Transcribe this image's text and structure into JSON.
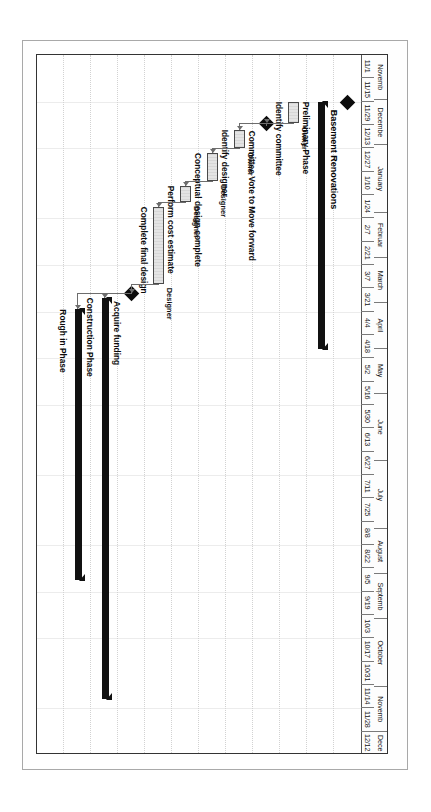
{
  "document": {
    "type": "gantt-chart-printout",
    "orientation": "rotated-90-clockwise",
    "project_title": "Basement Renovations"
  },
  "timescale": {
    "months": [
      {
        "label": "Novemb",
        "weeks": 2
      },
      {
        "label": "Decembe",
        "weeks": 2
      },
      {
        "label": "January",
        "weeks": 3
      },
      {
        "label": "Februar",
        "weeks": 2
      },
      {
        "label": "March",
        "weeks": 2
      },
      {
        "label": "April",
        "weeks": 2
      },
      {
        "label": "May",
        "weeks": 2
      },
      {
        "label": "June",
        "weeks": 3
      },
      {
        "label": "July",
        "weeks": 3
      },
      {
        "label": "August",
        "weeks": 2
      },
      {
        "label": "Septemb",
        "weeks": 2
      },
      {
        "label": "October",
        "weeks": 3
      },
      {
        "label": "Novemb",
        "weeks": 2
      },
      {
        "label": "Dece",
        "weeks": 1
      }
    ],
    "weeks": [
      "11/1",
      "11/15",
      "11/29",
      "12/13",
      "12/27",
      "1/10",
      "1/24",
      "2/7",
      "2/21",
      "3/7",
      "3/21",
      "4/4",
      "4/18",
      "5/2",
      "5/16",
      "5/30",
      "6/13",
      "6/27",
      "7/11",
      "7/25",
      "8/8",
      "8/22",
      "9/5",
      "9/19",
      "10/3",
      "10/17",
      "10/31",
      "11/14",
      "11/28",
      "12/12"
    ]
  },
  "chart_data": {
    "type": "bar",
    "chart_kind": "gantt",
    "title": "Basement Renovations",
    "xlabel": "",
    "ylabel": "",
    "x_axis_unit": "2-week periods",
    "x_tick_labels": [
      "11/1",
      "11/15",
      "11/29",
      "12/13",
      "12/27",
      "1/10",
      "1/24",
      "2/7",
      "2/21",
      "3/7",
      "3/21",
      "4/4",
      "4/18",
      "5/2",
      "5/16",
      "5/30",
      "6/13",
      "6/27",
      "7/11",
      "7/25",
      "8/8",
      "8/22",
      "9/5",
      "9/19",
      "10/3",
      "10/17",
      "10/31",
      "11/14",
      "11/28",
      "12/12"
    ],
    "grid": true,
    "legend": false,
    "categories": [
      "Basement Renovations",
      "Preliminary Phase",
      "Identify committee",
      "Committee Vote to Move forward",
      "Identify designer",
      "Conceptual design complete",
      "Perform cost estimate",
      "Complete final design",
      "Acquire funding",
      "Construction Phase",
      "Rough in Phase"
    ],
    "tasks": [
      {
        "name": "Basement Renovations",
        "kind": "milestone",
        "resource": "",
        "start_week": 2.0,
        "end_week": 2.0,
        "indent": 0
      },
      {
        "name": "Preliminary Phase",
        "kind": "summary",
        "resource": "",
        "start_week": 2.0,
        "end_week": 12.6,
        "indent": 1
      },
      {
        "name": "Identify committee",
        "kind": "task",
        "resource": "Owner",
        "start_week": 2.0,
        "end_week": 2.9,
        "indent": 2
      },
      {
        "name": "Committee Vote to Move forward",
        "kind": "milestone",
        "resource": "",
        "start_week": 2.9,
        "end_week": 2.9,
        "indent": 2
      },
      {
        "name": "Identify designer",
        "kind": "task",
        "resource": "Owner",
        "start_week": 3.2,
        "end_week": 4.0,
        "indent": 2
      },
      {
        "name": "Conceptual design complete",
        "kind": "task",
        "resource": "Designer",
        "start_week": 4.2,
        "end_week": 5.4,
        "indent": 2
      },
      {
        "name": "Perform cost estimate",
        "kind": "task",
        "resource": "Designer",
        "start_week": 5.6,
        "end_week": 6.3,
        "indent": 2
      },
      {
        "name": "Complete final design",
        "kind": "task",
        "resource": "Designer",
        "start_week": 6.5,
        "end_week": 9.8,
        "indent": 2
      },
      {
        "name": "Acquire funding",
        "kind": "milestone",
        "resource": "",
        "start_week": 10.2,
        "end_week": 10.2,
        "indent": 2
      },
      {
        "name": "Construction Phase",
        "kind": "summary",
        "resource": "",
        "start_week": 10.4,
        "end_week": 27.6,
        "indent": 1
      },
      {
        "name": "Rough in Phase",
        "kind": "summary",
        "resource": "",
        "start_week": 10.9,
        "end_week": 22.5,
        "indent": 2
      }
    ]
  }
}
